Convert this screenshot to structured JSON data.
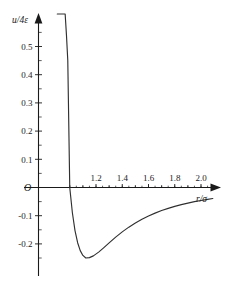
{
  "chart_data": {
    "type": "line",
    "title": "",
    "subtitle": "",
    "xlabel": "r/σ",
    "ylabel": "u/4ε",
    "origin_label": "O",
    "xlim": [
      0.85,
      2.12
    ],
    "ylim": [
      -0.3,
      0.62
    ],
    "grid": false,
    "legend": null,
    "curve_color": "#303030",
    "axis_color": "#1a1a1a",
    "x_ticks_major": [
      "1.2",
      "1.4",
      "1.6",
      "1.8",
      "2.0"
    ],
    "x_tick_major_values": [
      1.2,
      1.4,
      1.6,
      1.8,
      2.0
    ],
    "x_tick_minor_values": [
      1.0,
      1.1,
      1.3,
      1.5,
      1.7,
      1.9,
      2.1
    ],
    "y_ticks_major": [
      "0.5",
      "0.4",
      "0.3",
      "0.2",
      "0.1",
      "-0.1",
      "-0.2"
    ],
    "y_tick_major_values": [
      0.5,
      0.4,
      0.3,
      0.2,
      0.1,
      -0.1,
      -0.2
    ],
    "y_tick_minor_values": [
      0.55,
      0.45,
      0.35,
      0.25,
      0.15,
      0.05,
      -0.05,
      -0.15,
      -0.25
    ],
    "zero_crossing_x": 1.0,
    "minimum": {
      "x": 1.1225,
      "y": -0.25
    },
    "annotations": [],
    "series": [
      {
        "name": "Lennard-Jones potential",
        "formula": "u/4ε = (σ/r)^12 - (σ/r)^6",
        "x": [
          0.905,
          0.915,
          0.925,
          0.935,
          0.945,
          0.955,
          0.965,
          0.975,
          0.985,
          1.0,
          1.02,
          1.04,
          1.06,
          1.08,
          1.1,
          1.1225,
          1.15,
          1.18,
          1.22,
          1.26,
          1.3,
          1.35,
          1.4,
          1.45,
          1.5,
          1.55,
          1.6,
          1.65,
          1.7,
          1.75,
          1.8,
          1.85,
          1.9,
          1.95,
          2.0,
          2.05,
          2.09
        ],
        "y": [
          2.095,
          1.702,
          1.391,
          1.142,
          0.942,
          0.78,
          0.648,
          0.54,
          0.451,
          0.0,
          -0.0896,
          -0.1527,
          -0.1958,
          -0.2239,
          -0.2408,
          -0.25,
          -0.2486,
          -0.2424,
          -0.2291,
          -0.213,
          -0.1962,
          -0.1759,
          -0.1573,
          -0.1406,
          -0.1257,
          -0.1126,
          -0.101,
          -0.0908,
          -0.0818,
          -0.0739,
          -0.0669,
          -0.0607,
          -0.0552,
          -0.0503,
          -0.046,
          -0.0421,
          -0.0392
        ]
      }
    ]
  },
  "figure": {
    "background": "#ffffff",
    "width": 241,
    "height": 281
  }
}
